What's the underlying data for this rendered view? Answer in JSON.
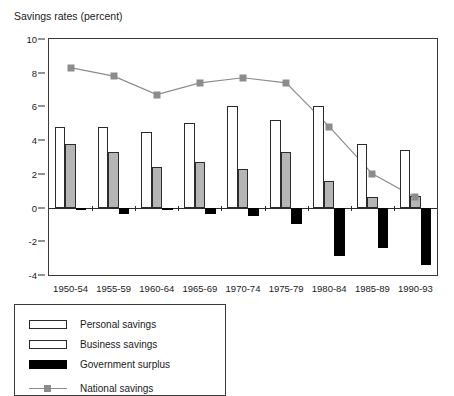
{
  "chart_data": {
    "type": "bar",
    "title": "Savings rates (percent)",
    "xlabel": "",
    "ylabel": "",
    "ylim": [
      -4,
      10
    ],
    "yticks": [
      10,
      8,
      6,
      4,
      2,
      0,
      -2,
      -4
    ],
    "grid": false,
    "legend_position": "below-left",
    "categories": [
      "1950-54",
      "1955-59",
      "1960-64",
      "1965-69",
      "1970-74",
      "1975-79",
      "1980-84",
      "1985-89",
      "1990-93"
    ],
    "series": [
      {
        "name": "Personal savings",
        "type": "bar",
        "color": "#ffffff",
        "values": [
          4.8,
          4.8,
          4.5,
          5.0,
          6.0,
          5.2,
          6.0,
          3.8,
          3.4
        ]
      },
      {
        "name": "Business savings",
        "type": "bar",
        "color": "#b5b5b5",
        "values": [
          3.8,
          3.3,
          2.4,
          2.7,
          2.3,
          3.3,
          1.6,
          0.6,
          0.7
        ]
      },
      {
        "name": "Government surplus",
        "type": "bar",
        "color": "#000000",
        "values": [
          0.0,
          -0.4,
          -0.1,
          -0.4,
          -0.5,
          -1.0,
          -2.9,
          -2.4,
          -3.4
        ]
      },
      {
        "name": "National savings",
        "type": "line",
        "color": "#8c8c8c",
        "marker": "square",
        "values": [
          8.3,
          7.8,
          6.7,
          7.4,
          7.7,
          7.4,
          4.8,
          2.0,
          0.6
        ]
      }
    ]
  },
  "legend": {
    "items": [
      {
        "label": "Personal savings",
        "swatch": "personal-swatch"
      },
      {
        "label": "Business savings",
        "swatch": "business-swatch"
      },
      {
        "label": "Government surplus",
        "swatch": "government-swatch"
      },
      {
        "label": "National savings",
        "swatch": "line-marker-swatch"
      }
    ]
  }
}
